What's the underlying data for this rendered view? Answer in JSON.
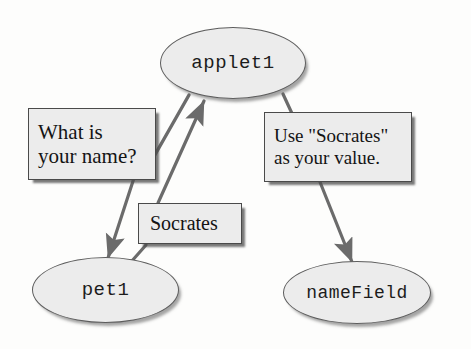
{
  "diagram": {
    "type": "object-interaction-diagram",
    "background_color": "#fdfdfc",
    "node_fill_color": "#ececec",
    "node_border_color": "#5d5d5d",
    "box_fill_color": "#ececec",
    "box_border_color": "#4a4a4a",
    "edge_color": "#6b6b6b",
    "text_color": "#141414",
    "nodes": [
      {
        "id": "applet1",
        "label": "applet1"
      },
      {
        "id": "pet1",
        "label": "pet1"
      },
      {
        "id": "nameField",
        "label": "nameField"
      }
    ],
    "messages": [
      {
        "id": "what-is-your-name",
        "from": "applet1",
        "to": "pet1",
        "line1": "What is",
        "line2": "your name?"
      },
      {
        "id": "use-socrates",
        "from": "applet1",
        "to": "nameField",
        "line1": "Use \"Socrates\"",
        "line2": "as your value."
      },
      {
        "id": "socrates-return",
        "from": "pet1",
        "to": "applet1",
        "line1": "Socrates"
      }
    ]
  }
}
